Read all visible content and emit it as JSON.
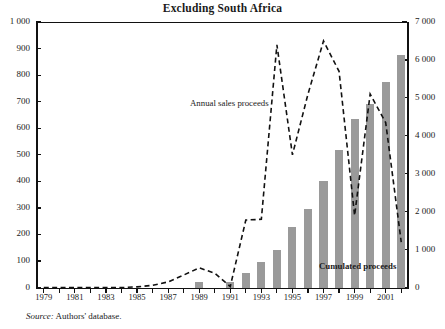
{
  "figure": {
    "title": "Excluding South Africa",
    "clipped_title_above": "",
    "source_prefix": "Source:",
    "source_text": "Authors' database."
  },
  "annotations": {
    "line_label": "Annual sales proceeds",
    "bar_label": "Cumulated proceeds"
  },
  "chart_data": {
    "type": "bar",
    "title": "Excluding South Africa",
    "xlabel": "",
    "ylabel": "",
    "grid": false,
    "legend": "inline-annotations",
    "x": [
      1979,
      1980,
      1981,
      1982,
      1983,
      1984,
      1985,
      1986,
      1987,
      1988,
      1989,
      1990,
      1991,
      1992,
      1993,
      1994,
      1995,
      1996,
      1997,
      1998,
      1999,
      2000,
      2001,
      2002
    ],
    "xlim": [
      1978.5,
      2002.5
    ],
    "xticks": [
      1979,
      1980,
      1981,
      1982,
      1983,
      1984,
      1985,
      1986,
      1987,
      1988,
      1989,
      1990,
      1991,
      1992,
      1993,
      1994,
      1995,
      1996,
      1997,
      1998,
      1999,
      2000,
      2001,
      2002
    ],
    "xticklabels": [
      "1979",
      "",
      "1981",
      "",
      "1983",
      "",
      "1985",
      "",
      "1987",
      "",
      "1989",
      "",
      "1991",
      "",
      "1993",
      "",
      "1995",
      "",
      "1997",
      "",
      "1999",
      "",
      "2001",
      ""
    ],
    "axes": [
      {
        "side": "left",
        "ylim": [
          0,
          1000
        ],
        "yticks": [
          0,
          100,
          200,
          300,
          400,
          500,
          600,
          700,
          800,
          900,
          1000
        ],
        "yticklabels": [
          "0",
          "100",
          "200",
          "300",
          "400",
          "500",
          "600",
          "700",
          "800",
          "900",
          "1 000"
        ]
      },
      {
        "side": "right",
        "ylim": [
          0,
          7000
        ],
        "yticks": [
          0,
          1000,
          2000,
          3000,
          4000,
          5000,
          6000,
          7000
        ],
        "yticklabels": [
          "0",
          "1 000",
          "2 000",
          "3 000",
          "4 000",
          "5 000",
          "6 000",
          "7 000"
        ]
      }
    ],
    "series": [
      {
        "name": "Cumulated proceeds",
        "type": "bar",
        "axis": "left",
        "color": "#9a9a9a",
        "values": [
          0,
          0,
          0,
          0,
          0,
          0,
          0,
          0,
          0,
          0,
          22,
          0,
          22,
          55,
          95,
          140,
          230,
          295,
          400,
          520,
          635,
          690,
          775,
          875
        ]
      },
      {
        "name": "Annual sales proceeds",
        "type": "line",
        "axis": "right",
        "style": "dashed",
        "color": "#111111",
        "values": [
          0,
          0,
          0,
          0,
          0,
          0,
          20,
          60,
          150,
          330,
          520,
          380,
          30,
          1780,
          1800,
          6400,
          3500,
          5100,
          6500,
          5700,
          1900,
          5100,
          4350,
          1200
        ]
      }
    ]
  }
}
